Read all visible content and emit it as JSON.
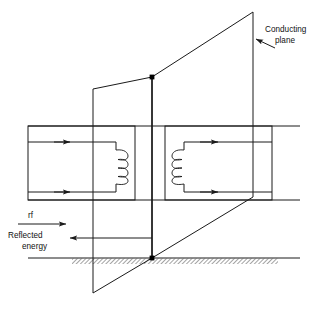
{
  "figure": {
    "type": "technical-line-diagram",
    "background_color": "#ffffff",
    "line_color": "#1a1a1a"
  },
  "labels": {
    "conducting_plane_line1": "Conducting",
    "conducting_plane_line2": "plane",
    "rf": "rf",
    "reflected_line1": "Reflected",
    "reflected_line2": "energy"
  },
  "annotations": [
    {
      "name": "conducting-plane-label",
      "text": "Conducting plane",
      "x": 262,
      "y": 36,
      "leader_arrow": "points left-down to right vertical edge of plane"
    },
    {
      "name": "rf-label",
      "text": "rf",
      "x": 28,
      "y": 216,
      "arrow_direction": "right"
    },
    {
      "name": "reflected-energy-label",
      "text": "Reflected energy",
      "x": 8,
      "y": 238,
      "arrow_direction": "left"
    }
  ],
  "elements": {
    "large_plane": {
      "name": "conducting-plane-parallelogram",
      "points": "253,12 152,77 152,258 253,197"
    },
    "small_plane": {
      "name": "near-plane-parallelogram",
      "points": "152,77 93,89 93,293 152,258"
    },
    "vertical_axis": {
      "name": "plane-intersection-line",
      "x": 152,
      "y_top": 77,
      "y_bottom": 258
    },
    "ground": {
      "name": "ground-line",
      "y": 258,
      "x_start": 28,
      "x_end": 300,
      "hatch_start": 72,
      "hatch_end": 278
    },
    "junction_dots": [
      {
        "name": "junction-top",
        "x": 152,
        "y": 77,
        "r": 2.6
      },
      {
        "name": "junction-bottom",
        "x": 152,
        "y": 258,
        "r": 2.6
      }
    ],
    "left_loop": {
      "name": "left-coupling-loop",
      "box": {
        "x": 28,
        "y": 126,
        "w": 107,
        "h": 74
      },
      "coil_turns": 4,
      "arrows": [
        {
          "name": "left-loop-top-arrow",
          "x": 68,
          "y": 142,
          "direction": "right"
        },
        {
          "name": "left-loop-bottom-arrow",
          "x": 68,
          "y": 192,
          "direction": "right"
        }
      ]
    },
    "right_loop": {
      "name": "right-coupling-loop",
      "box": {
        "x": 165,
        "y": 126,
        "w": 107,
        "h": 74
      },
      "coil_turns": 4,
      "arrows": [
        {
          "name": "right-loop-top-arrow",
          "x": 215,
          "y": 142,
          "direction": "right"
        },
        {
          "name": "right-loop-bottom-arrow",
          "x": 215,
          "y": 192,
          "direction": "right"
        }
      ]
    },
    "rf_arrow": {
      "name": "rf-incident-arrow",
      "x_start": 22,
      "x_end": 66,
      "y": 224
    },
    "reflected_arrow": {
      "name": "reflected-energy-arrow",
      "x_start": 152,
      "x_end": 70,
      "y": 238
    }
  }
}
